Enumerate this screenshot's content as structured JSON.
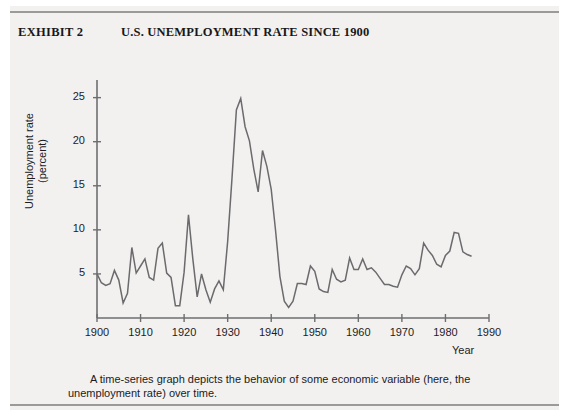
{
  "header": {
    "exhibit_label": "EXHIBIT 2",
    "title": "U.S. UNEMPLOYMENT RATE SINCE 1900"
  },
  "caption": {
    "line1": "A time-series graph depicts the behavior of some economic variable (here, the",
    "line2": "unemployment rate) over time."
  },
  "axis": {
    "y_title_line1": "Unemployment rate",
    "y_title_line2": "(percent)",
    "x_title": "Year"
  },
  "colors": {
    "page_background": "#f2f1ef",
    "line": "#6b6b6e",
    "axis": "#6e6e71",
    "text": "#1d1c1f",
    "rule": "#9a9a98"
  },
  "chart_data": {
    "type": "line",
    "title": "U.S. UNEMPLOYMENT RATE SINCE 1900",
    "xlabel": "Year",
    "ylabel": "Unemployment rate (percent)",
    "xlim": [
      1900,
      1990
    ],
    "ylim": [
      0,
      27
    ],
    "grid": false,
    "legend": null,
    "xticks": [
      1900,
      1910,
      1920,
      1930,
      1940,
      1950,
      1960,
      1970,
      1980,
      1990
    ],
    "xtick_labels": [
      "1900",
      "1910",
      "1920",
      "1930",
      "1940",
      "1950",
      "1960",
      "1970",
      "1980",
      "1990"
    ],
    "yticks": [
      5,
      10,
      15,
      20,
      25
    ],
    "ytick_labels": [
      "5",
      "10",
      "15",
      "20",
      "25"
    ],
    "series": [
      {
        "name": "U.S. unemployment rate",
        "x": [
          1900,
          1901,
          1902,
          1903,
          1904,
          1905,
          1906,
          1907,
          1908,
          1909,
          1910,
          1911,
          1912,
          1913,
          1914,
          1915,
          1916,
          1917,
          1918,
          1919,
          1920,
          1921,
          1922,
          1923,
          1924,
          1925,
          1926,
          1927,
          1928,
          1929,
          1930,
          1931,
          1932,
          1933,
          1934,
          1935,
          1936,
          1937,
          1938,
          1939,
          1940,
          1941,
          1942,
          1943,
          1944,
          1945,
          1946,
          1947,
          1948,
          1949,
          1950,
          1951,
          1952,
          1953,
          1954,
          1955,
          1956,
          1957,
          1958,
          1959,
          1960,
          1961,
          1962,
          1963,
          1964,
          1965,
          1966,
          1967,
          1968,
          1969,
          1970,
          1971,
          1972,
          1973,
          1974,
          1975,
          1976,
          1977,
          1978,
          1979,
          1980,
          1981,
          1982,
          1983,
          1984,
          1985,
          1986
        ],
        "values": [
          5.0,
          4.0,
          3.7,
          3.9,
          5.4,
          4.3,
          1.7,
          2.8,
          8.0,
          5.1,
          5.9,
          6.7,
          4.6,
          4.3,
          7.9,
          8.5,
          5.1,
          4.6,
          1.4,
          1.4,
          5.2,
          11.7,
          6.7,
          2.4,
          5.0,
          3.2,
          1.8,
          3.3,
          4.2,
          3.2,
          8.7,
          15.9,
          23.6,
          24.9,
          21.7,
          20.1,
          16.9,
          14.3,
          19.0,
          17.2,
          14.6,
          9.9,
          4.7,
          1.9,
          1.2,
          1.9,
          3.9,
          3.9,
          3.8,
          5.9,
          5.3,
          3.3,
          3.0,
          2.9,
          5.5,
          4.4,
          4.1,
          4.3,
          6.8,
          5.5,
          5.5,
          6.7,
          5.5,
          5.7,
          5.2,
          4.5,
          3.8,
          3.8,
          3.6,
          3.5,
          4.9,
          5.9,
          5.6,
          4.9,
          5.6,
          8.5,
          7.7,
          7.1,
          6.1,
          5.8,
          7.1,
          7.6,
          9.7,
          9.6,
          7.5,
          7.2,
          7.0
        ]
      }
    ],
    "annotations": [
      {
        "label": "Great Depression peak",
        "x": 1933,
        "y": 24.9
      },
      {
        "label": "1938 recession peak",
        "x": 1938,
        "y": 19.0
      },
      {
        "label": "World War II trough",
        "x": 1944,
        "y": 1.2
      },
      {
        "label": "1921 postwar spike",
        "x": 1921,
        "y": 11.7
      }
    ]
  }
}
